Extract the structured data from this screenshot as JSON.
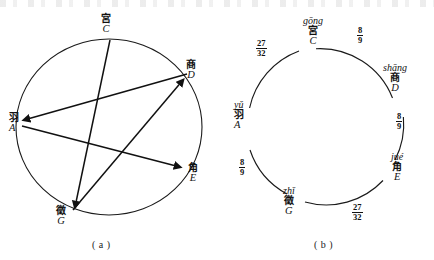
{
  "figure": {
    "caption_a": "( a )",
    "caption_b": "( b )"
  },
  "diagram_a": {
    "title": "pentatonic generation circle with arrows",
    "notes": [
      {
        "han": "宮",
        "letter": "C",
        "position": "top"
      },
      {
        "han": "商",
        "letter": "D",
        "position": "upper-right"
      },
      {
        "han": "羽",
        "letter": "A",
        "position": "left"
      },
      {
        "han": "角",
        "letter": "E",
        "position": "lower-right"
      },
      {
        "han": "徵",
        "letter": "G",
        "position": "bottom"
      }
    ],
    "arrows": [
      {
        "from": "C",
        "to": "G"
      },
      {
        "from": "G",
        "to": "D"
      },
      {
        "from": "D",
        "to": "A"
      },
      {
        "from": "A",
        "to": "E"
      }
    ]
  },
  "diagram_b": {
    "title": "pentatonic ratio circle",
    "notes": [
      {
        "rom": "gōng",
        "han": "宮",
        "letter": "C",
        "position": "top"
      },
      {
        "rom": "shāng",
        "han": "商",
        "letter": "D",
        "position": "upper-right"
      },
      {
        "rom": "jué",
        "han": "角",
        "letter": "E",
        "position": "lower-right"
      },
      {
        "rom": "zhǐ",
        "han": "徵",
        "letter": "G",
        "position": "bottom-left"
      },
      {
        "rom": "yǔ",
        "han": "羽",
        "letter": "A",
        "position": "left"
      }
    ],
    "ratios": [
      {
        "num": "8",
        "den": "9",
        "between": "C-D",
        "position": "upper-right"
      },
      {
        "num": "8",
        "den": "9",
        "between": "D-E",
        "position": "right"
      },
      {
        "num": "27",
        "den": "32",
        "between": "E-G",
        "position": "lower-right"
      },
      {
        "num": "8",
        "den": "9",
        "between": "G-A",
        "position": "lower-left"
      },
      {
        "num": "27",
        "den": "32",
        "between": "A-C",
        "position": "upper-left"
      }
    ]
  }
}
